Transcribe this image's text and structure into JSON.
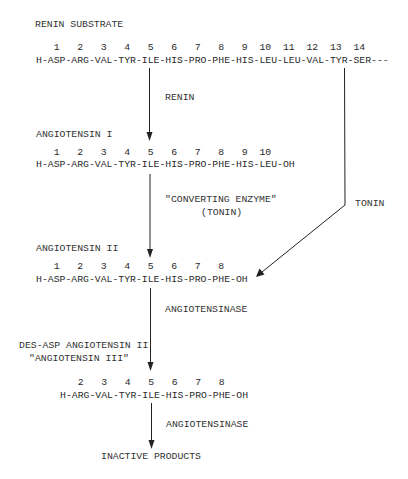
{
  "diagram": {
    "renin_substrate": {
      "title": "RENIN SUBSTRATE",
      "numbers": "   1   2   3   4   5   6   7   8   9  10  11  12  13  14",
      "sequence": "H-ASP-ARG-VAL-TYR-ILE-HIS-PRO-PHE-HIS-LEU-LEU-VAL-TYR-SER---"
    },
    "step1_enzyme": "RENIN",
    "angiotensin_1": {
      "title": "ANGIOTENSIN I",
      "numbers": "   1   2   3   4   5   6   7   8   9  10",
      "sequence": "H-ASP-ARG-VAL-TYR-ILE-HIS-PRO-PHE-HIS-LEU-OH"
    },
    "step2_enzyme_line1": "\"CONVERTING ENZYME\"",
    "step2_enzyme_line2": "(TONIN)",
    "side_enzyme": "TONIN",
    "angiotensin_2": {
      "title": "ANGIOTENSIN II",
      "numbers": "   1   2   3   4   5   6   7   8",
      "sequence": "H-ASP-ARG-VAL-TYR-ILE-HIS-PRO-PHE-OH"
    },
    "step3_enzyme": "ANGIOTENSINASE",
    "angiotensin_3": {
      "title_line1": "DES-ASP ANGIOTENSIN II",
      "title_line2": "\"ANGIOTENSIN III\"",
      "numbers": "   2   3   4   5   6   7   8",
      "sequence": "H-ARG-VAL-TYR-ILE-HIS-PRO-PHE-OH"
    },
    "step4_enzyme": "ANGIOTENSINASE",
    "final_product": "INACTIVE PRODUCTS",
    "colors": {
      "text": "#2a2a2a",
      "line": "#222222",
      "background": "#ffffff"
    }
  }
}
